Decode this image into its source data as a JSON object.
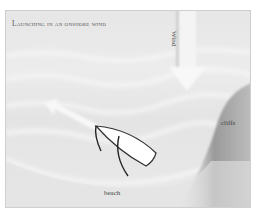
{
  "diagram": {
    "title": "Launching in an onshore wind",
    "labels": {
      "wind": "Wind",
      "cliffs": "cliffs",
      "beach": "beach"
    },
    "colors": {
      "background": "#e8e8e8",
      "arrow": "#fafafa",
      "boat_fill": "#ffffff",
      "boat_outline": "#333333",
      "cliff_shade": "#8a8a8a",
      "text": "#444444"
    }
  }
}
